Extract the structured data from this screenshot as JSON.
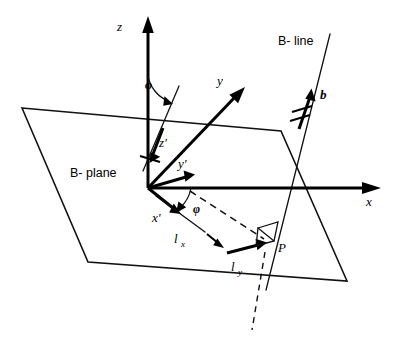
{
  "figure": {
    "background_color": "#ffffff",
    "ink_color": "#000000",
    "width": 395,
    "height": 339
  },
  "labels": {
    "axis_z": "z",
    "axis_y": "y",
    "axis_x": "x",
    "axis_z_prime": "z'",
    "axis_y_prime": "y'",
    "axis_x_prime": "x'",
    "b_line": "B- line",
    "b_plane": "B- plane",
    "burgers_vector": "b",
    "angle_upper": "φ",
    "angle_lower": "φ",
    "l_x": "l",
    "l_x_sub": "x",
    "l_y": "l",
    "l_y_sub": "y",
    "point_p": "P"
  },
  "geometry": {
    "origin": {
      "x": 148,
      "y": 188
    },
    "plane_corners": [
      {
        "name": "top-left",
        "x": 22,
        "y": 108
      },
      {
        "name": "top-right",
        "x": 281,
        "y": 131
      },
      {
        "name": "bottom-right",
        "x": 347,
        "y": 281
      },
      {
        "name": "bottom-left",
        "x": 88,
        "y": 262
      }
    ],
    "axis_z_tip": {
      "x": 148,
      "y": 18
    },
    "axis_y_tip": {
      "x": 242,
      "y": 89
    },
    "axis_x_tip": {
      "x": 380,
      "y": 188
    },
    "axis_z_prime_tip": {
      "x": 152,
      "y": 155
    },
    "axis_y_prime_tip": {
      "x": 195,
      "y": 175
    },
    "axis_x_prime_tip": {
      "x": 181,
      "y": 213
    },
    "point_p": {
      "x": 272,
      "y": 243
    },
    "b_line_top": {
      "x": 330,
      "y": 34
    },
    "b_line_bottom": {
      "x": 266,
      "y": 290
    },
    "b_vector_tip": {
      "x": 311,
      "y": 92
    }
  }
}
